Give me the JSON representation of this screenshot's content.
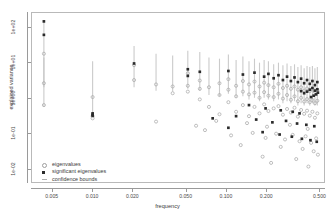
{
  "chart_data": {
    "type": "scatter",
    "title": "",
    "xlabel": "frequency",
    "ylabel": "explained variance",
    "xscale": "log",
    "yscale": "log",
    "xlim": [
      0.0035,
      0.55
    ],
    "ylim": [
      0.004,
      260
    ],
    "grid": false,
    "xticks": [
      0.005,
      0.01,
      0.02,
      0.05,
      0.1,
      0.2,
      0.5
    ],
    "xticklabels": [
      "0.005",
      "0.010",
      "0.020",
      "0.050",
      "0.100",
      "0.200",
      "0.500"
    ],
    "yticks": [
      100,
      10,
      1,
      0.1,
      0.01
    ],
    "yticklabels": [
      "1e+02",
      "1e+01",
      "1e+00",
      "1e-01",
      "1e-02"
    ],
    "legend": {
      "position": "bottom-left",
      "entries": [
        {
          "label": "eigenvalues",
          "marker": "open-circle",
          "color": "#9e9e9e"
        },
        {
          "label": "significant eigenvalues",
          "marker": "filled-square",
          "color": "#2b2b2b"
        },
        {
          "label": "confidence bounds",
          "marker": "vertical-line",
          "color": "#b0b0b0"
        }
      ]
    },
    "series": [
      {
        "name": "confidence bounds",
        "type": "errorbar",
        "color": "#c2c2c2",
        "bars": [
          {
            "x": 0.0043,
            "lo": 2.0,
            "hi": 150.0
          },
          {
            "x": 0.0043,
            "lo": 0.55,
            "hi": 14.0
          },
          {
            "x": 0.01,
            "lo": 0.32,
            "hi": 11.0
          },
          {
            "x": 0.0205,
            "lo": 2.0,
            "hi": 30.0
          },
          {
            "x": 0.03,
            "lo": 1.6,
            "hi": 18.0
          },
          {
            "x": 0.04,
            "lo": 1.5,
            "hi": 16.0
          },
          {
            "x": 0.052,
            "lo": 1.8,
            "hi": 22.0
          },
          {
            "x": 0.064,
            "lo": 1.6,
            "hi": 20.0
          },
          {
            "x": 0.075,
            "lo": 1.2,
            "hi": 14.0
          },
          {
            "x": 0.09,
            "lo": 1.1,
            "hi": 13.0
          },
          {
            "x": 0.105,
            "lo": 1.3,
            "hi": 17.0
          },
          {
            "x": 0.12,
            "lo": 1.0,
            "hi": 12.0
          },
          {
            "x": 0.135,
            "lo": 1.1,
            "hi": 15.0
          },
          {
            "x": 0.15,
            "lo": 0.9,
            "hi": 11.0
          },
          {
            "x": 0.165,
            "lo": 1.0,
            "hi": 13.0
          },
          {
            "x": 0.18,
            "lo": 0.8,
            "hi": 10.0
          },
          {
            "x": 0.195,
            "lo": 1.0,
            "hi": 12.0
          },
          {
            "x": 0.21,
            "lo": 0.9,
            "hi": 11.0
          },
          {
            "x": 0.23,
            "lo": 0.8,
            "hi": 9.0
          },
          {
            "x": 0.25,
            "lo": 0.9,
            "hi": 10.0
          },
          {
            "x": 0.27,
            "lo": 0.7,
            "hi": 8.5
          },
          {
            "x": 0.29,
            "lo": 0.8,
            "hi": 9.5
          },
          {
            "x": 0.31,
            "lo": 0.7,
            "hi": 8.0
          },
          {
            "x": 0.33,
            "lo": 0.8,
            "hi": 9.0
          },
          {
            "x": 0.35,
            "lo": 0.6,
            "hi": 7.5
          },
          {
            "x": 0.37,
            "lo": 0.7,
            "hi": 8.5
          },
          {
            "x": 0.39,
            "lo": 0.6,
            "hi": 7.0
          },
          {
            "x": 0.41,
            "lo": 0.7,
            "hi": 8.0
          },
          {
            "x": 0.43,
            "lo": 0.6,
            "hi": 7.5
          },
          {
            "x": 0.45,
            "lo": 0.7,
            "hi": 8.0
          },
          {
            "x": 0.47,
            "lo": 0.6,
            "hi": 7.0
          },
          {
            "x": 0.49,
            "lo": 0.6,
            "hi": 7.5
          }
        ]
      },
      {
        "name": "eigenvalues",
        "type": "scatter",
        "marker": "open-circle",
        "color": "#a8a8a8",
        "points": [
          [
            0.0043,
            18.0
          ],
          [
            0.0043,
            2.6
          ],
          [
            0.0043,
            0.62
          ],
          [
            0.01,
            1.05
          ],
          [
            0.01,
            0.3
          ],
          [
            0.01,
            0.26
          ],
          [
            0.0205,
            8.5
          ],
          [
            0.0205,
            3.2
          ],
          [
            0.03,
            2.4
          ],
          [
            0.03,
            0.21
          ],
          [
            0.04,
            2.1
          ],
          [
            0.04,
            1.35
          ],
          [
            0.052,
            5.0
          ],
          [
            0.052,
            2.2
          ],
          [
            0.052,
            1.5
          ],
          [
            0.064,
            3.1
          ],
          [
            0.064,
            1.8
          ],
          [
            0.064,
            0.9
          ],
          [
            0.075,
            2.0
          ],
          [
            0.075,
            0.55
          ],
          [
            0.09,
            2.6
          ],
          [
            0.09,
            1.2
          ],
          [
            0.09,
            0.34
          ],
          [
            0.105,
            3.4
          ],
          [
            0.105,
            1.7
          ],
          [
            0.105,
            0.75
          ],
          [
            0.12,
            2.2
          ],
          [
            0.12,
            1.1
          ],
          [
            0.12,
            0.4
          ],
          [
            0.135,
            3.0
          ],
          [
            0.135,
            1.5
          ],
          [
            0.135,
            0.62
          ],
          [
            0.15,
            2.4
          ],
          [
            0.15,
            1.25
          ],
          [
            0.15,
            0.3
          ],
          [
            0.165,
            2.9
          ],
          [
            0.165,
            1.4
          ],
          [
            0.165,
            0.55
          ],
          [
            0.18,
            2.1
          ],
          [
            0.18,
            1.0
          ],
          [
            0.18,
            0.36
          ],
          [
            0.195,
            2.7
          ],
          [
            0.195,
            1.45
          ],
          [
            0.195,
            0.65
          ],
          [
            0.21,
            2.3
          ],
          [
            0.21,
            1.15
          ],
          [
            0.21,
            0.42
          ],
          [
            0.23,
            2.0
          ],
          [
            0.23,
            1.05
          ],
          [
            0.23,
            0.5
          ],
          [
            0.25,
            2.5
          ],
          [
            0.25,
            1.3
          ],
          [
            0.25,
            0.58
          ],
          [
            0.27,
            1.9
          ],
          [
            0.27,
            0.95
          ],
          [
            0.27,
            0.33
          ],
          [
            0.29,
            2.2
          ],
          [
            0.29,
            1.2
          ],
          [
            0.29,
            0.48
          ],
          [
            0.31,
            1.8
          ],
          [
            0.31,
            0.88
          ],
          [
            0.31,
            0.38
          ],
          [
            0.33,
            2.1
          ],
          [
            0.33,
            1.1
          ],
          [
            0.33,
            0.52
          ],
          [
            0.35,
            1.7
          ],
          [
            0.35,
            0.8
          ],
          [
            0.35,
            0.29
          ],
          [
            0.37,
            2.0
          ],
          [
            0.37,
            1.0
          ],
          [
            0.37,
            0.45
          ],
          [
            0.39,
            1.6
          ],
          [
            0.39,
            0.78
          ],
          [
            0.39,
            0.35
          ],
          [
            0.41,
            1.85
          ],
          [
            0.41,
            0.92
          ],
          [
            0.41,
            0.43
          ],
          [
            0.43,
            1.55
          ],
          [
            0.43,
            0.75
          ],
          [
            0.43,
            0.31
          ],
          [
            0.45,
            1.75
          ],
          [
            0.45,
            0.86
          ],
          [
            0.45,
            0.4
          ],
          [
            0.47,
            1.45
          ],
          [
            0.47,
            0.7
          ],
          [
            0.47,
            0.27
          ],
          [
            0.49,
            1.65
          ],
          [
            0.49,
            0.82
          ],
          [
            0.49,
            0.36
          ],
          [
            0.07,
            0.12
          ],
          [
            0.11,
            0.085
          ],
          [
            0.16,
            0.1
          ],
          [
            0.2,
            0.072
          ],
          [
            0.24,
            0.095
          ],
          [
            0.28,
            0.065
          ],
          [
            0.32,
            0.088
          ],
          [
            0.36,
            0.058
          ],
          [
            0.4,
            0.08
          ],
          [
            0.44,
            0.052
          ],
          [
            0.48,
            0.07
          ],
          [
            0.13,
            0.045
          ],
          [
            0.26,
            0.04
          ],
          [
            0.38,
            0.035
          ],
          [
            0.46,
            0.03
          ],
          [
            0.19,
            0.021
          ],
          [
            0.34,
            0.018
          ],
          [
            0.495,
            0.024
          ],
          [
            0.22,
            0.014
          ],
          [
            0.42,
            0.011
          ],
          [
            0.06,
            0.16
          ],
          [
            0.085,
            0.22
          ],
          [
            0.145,
            0.19
          ],
          [
            0.205,
            0.15
          ],
          [
            0.305,
            0.17
          ],
          [
            0.415,
            0.13
          ]
        ]
      },
      {
        "name": "significant eigenvalues",
        "type": "scatter",
        "marker": "filled-square",
        "color": "#2b2b2b",
        "points": [
          [
            0.0043,
            150.0
          ],
          [
            0.0043,
            62.0
          ],
          [
            0.01,
            0.36
          ],
          [
            0.01,
            0.33
          ],
          [
            0.01,
            0.31
          ],
          [
            0.0205,
            9.5
          ],
          [
            0.052,
            6.5
          ],
          [
            0.052,
            4.2
          ],
          [
            0.064,
            5.5
          ],
          [
            0.105,
            5.8
          ],
          [
            0.135,
            4.6
          ],
          [
            0.165,
            5.2
          ],
          [
            0.195,
            4.0
          ],
          [
            0.21,
            4.8
          ],
          [
            0.23,
            3.6
          ],
          [
            0.25,
            4.4
          ],
          [
            0.27,
            3.2
          ],
          [
            0.29,
            4.0
          ],
          [
            0.31,
            3.0
          ],
          [
            0.33,
            3.8
          ],
          [
            0.35,
            2.8
          ],
          [
            0.37,
            3.5
          ],
          [
            0.39,
            2.6
          ],
          [
            0.41,
            3.2
          ],
          [
            0.43,
            2.5
          ],
          [
            0.45,
            3.0
          ],
          [
            0.47,
            2.3
          ],
          [
            0.49,
            2.8
          ],
          [
            0.45,
            1.9
          ],
          [
            0.47,
            1.6
          ],
          [
            0.49,
            1.75
          ],
          [
            0.43,
            1.7
          ],
          [
            0.41,
            1.5
          ],
          [
            0.39,
            1.35
          ],
          [
            0.37,
            1.55
          ],
          [
            0.48,
            1.25
          ],
          [
            0.46,
            1.15
          ],
          [
            0.44,
            1.05
          ],
          [
            0.495,
            1.4
          ],
          [
            0.15,
            0.62
          ],
          [
            0.2,
            0.5
          ],
          [
            0.26,
            0.44
          ],
          [
            0.32,
            0.4
          ],
          [
            0.36,
            0.36
          ],
          [
            0.12,
            0.3
          ],
          [
            0.08,
            0.26
          ],
          [
            0.17,
            0.24
          ],
          [
            0.225,
            0.2
          ],
          [
            0.285,
            0.22
          ],
          [
            0.345,
            0.185
          ],
          [
            0.405,
            0.17
          ],
          [
            0.465,
            0.155
          ],
          [
            0.105,
            0.14
          ],
          [
            0.19,
            0.105
          ],
          [
            0.255,
            0.09
          ],
          [
            0.315,
            0.078
          ],
          [
            0.375,
            0.068
          ],
          [
            0.435,
            0.062
          ],
          [
            0.485,
            0.056
          ]
        ]
      }
    ]
  }
}
